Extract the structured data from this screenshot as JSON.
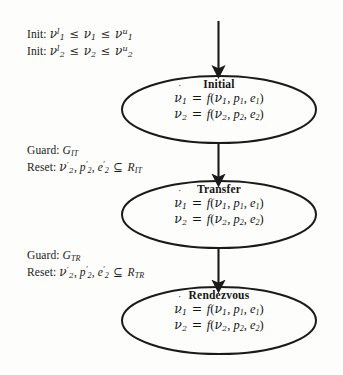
{
  "figure": {
    "type": "hybrid-automaton-state-diagram",
    "background_color": "#fdfdfb",
    "ink_color": "#1a1a1a"
  },
  "init_block": {
    "line1": {
      "label": "Init:",
      "lhs": "ν",
      "lhs_sub": "1",
      "lhs_sup": "l",
      "rel1": "≤",
      "mid": "ν",
      "mid_sub": "1",
      "rel2": "≤",
      "rhs": "ν",
      "rhs_sub": "1",
      "rhs_sup": "u",
      "plain": "Init: ν₁ˡ ≤ ν₁ ≤ ν₁ᵘ"
    },
    "line2": {
      "label": "Init:",
      "lhs": "ν",
      "lhs_sub": "2",
      "lhs_sup": "l",
      "rel1": "≤",
      "mid": "ν",
      "mid_sub": "2",
      "rel2": "≤",
      "rhs": "ν",
      "rhs_sub": "2",
      "rhs_sup": "u",
      "plain": "Init: ν₂ˡ ≤ ν₂ ≤ ν₂ᵘ"
    }
  },
  "transitions": [
    {
      "id": "initial-to-transfer",
      "guard_label": "Guard:",
      "guard_symbol": "G",
      "guard_sub": "IT",
      "reset_label": "Reset:",
      "reset_vars": [
        {
          "base": "ν",
          "sub": "2",
          "prime": "′"
        },
        {
          "base": "p",
          "sub": "2",
          "prime": "′"
        },
        {
          "base": "e",
          "sub": "2",
          "prime": "′"
        }
      ],
      "reset_rel": "⊆",
      "reset_target": "R",
      "reset_target_sub": "IT",
      "plain_guard": "Guard: G_IT",
      "plain_reset": "Reset: ν₂′, p₂′, e₂′ ⊆ R_IT"
    },
    {
      "id": "transfer-to-rendezvous",
      "guard_label": "Guard:",
      "guard_symbol": "G",
      "guard_sub": "TR",
      "reset_label": "Reset:",
      "reset_vars": [
        {
          "base": "ν",
          "sub": "2",
          "prime": "′"
        },
        {
          "base": "p",
          "sub": "2",
          "prime": "′"
        },
        {
          "base": "e",
          "sub": "2",
          "prime": "′"
        }
      ],
      "reset_rel": "⊆",
      "reset_target": "R",
      "reset_target_sub": "TR",
      "plain_guard": "Guard: G_TR",
      "plain_reset": "Reset: ν₂′, p₂′, e₂′ ⊆ R_TR"
    }
  ],
  "states": [
    {
      "id": "initial",
      "name": "Initial",
      "equations": [
        {
          "lhs_base": "ν",
          "lhs_dot": "˙",
          "lhs_sub": "1",
          "eq": "=",
          "fn": "f",
          "args": [
            {
              "base": "ν",
              "sub": "1"
            },
            {
              "base": "p",
              "sub": "1"
            },
            {
              "base": "e",
              "sub": "1"
            }
          ],
          "plain": "ν̇₁ = f(ν₁, p₁, e₁)"
        },
        {
          "lhs_base": "ν",
          "lhs_dot": "˙",
          "lhs_sub": "2",
          "eq": "=",
          "fn": "f",
          "args": [
            {
              "base": "ν",
              "sub": "2"
            },
            {
              "base": "p",
              "sub": "2"
            },
            {
              "base": "e",
              "sub": "2"
            }
          ],
          "plain": "ν̇₂ = f(ν₂, p₂, e₂)"
        }
      ]
    },
    {
      "id": "transfer",
      "name": "Transfer",
      "equations": [
        {
          "lhs_base": "ν",
          "lhs_dot": "˙",
          "lhs_sub": "1",
          "eq": "=",
          "fn": "f",
          "args": [
            {
              "base": "ν",
              "sub": "1"
            },
            {
              "base": "p",
              "sub": "1"
            },
            {
              "base": "e",
              "sub": "1"
            }
          ],
          "plain": "ν̇₁ = f(ν₁, p₁, e₁)"
        },
        {
          "lhs_base": "ν",
          "lhs_dot": "˙",
          "lhs_sub": "2",
          "eq": "=",
          "fn": "f",
          "args": [
            {
              "base": "ν",
              "sub": "2"
            },
            {
              "base": "p",
              "sub": "2"
            },
            {
              "base": "e",
              "sub": "2"
            }
          ],
          "plain": "ν̇₂ = f(ν₂, p₂, e₂)"
        }
      ]
    },
    {
      "id": "rendezvous",
      "name": "Rendezvous",
      "equations": [
        {
          "lhs_base": "ν",
          "lhs_dot": "˙",
          "lhs_sub": "1",
          "eq": "=",
          "fn": "f",
          "args": [
            {
              "base": "ν",
              "sub": "1"
            },
            {
              "base": "p",
              "sub": "1"
            },
            {
              "base": "e",
              "sub": "1"
            }
          ],
          "plain": "ν̇₁ = f(ν₁, p₁, e₁)"
        },
        {
          "lhs_base": "ν",
          "lhs_dot": "˙",
          "lhs_sub": "2",
          "eq": "=",
          "fn": "f",
          "args": [
            {
              "base": "ν",
              "sub": "2"
            },
            {
              "base": "p",
              "sub": "2"
            },
            {
              "base": "e",
              "sub": "2"
            }
          ],
          "plain": "ν̇₂ = f(ν₂, p₂, e₂)"
        }
      ]
    }
  ],
  "arrows": [
    {
      "id": "entry-arrow",
      "from": "none",
      "to": "initial"
    },
    {
      "id": "arrow-initial-transfer",
      "from": "initial",
      "to": "transfer"
    },
    {
      "id": "arrow-transfer-rendezvous",
      "from": "transfer",
      "to": "rendezvous"
    }
  ],
  "punctuation": {
    "comma": ",",
    "lparen": "(",
    "rparen": ")",
    "colon": ":"
  }
}
